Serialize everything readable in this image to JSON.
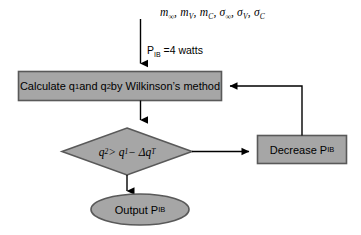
{
  "diagram": {
    "background_color": "#ffffff",
    "shape_fill": "#a6a6a6",
    "shape_stroke": "#595959",
    "line_color": "#000000",
    "inputs": {
      "label_html": "m<sub>∞</sub>, m<sub>V</sub>, m<sub>C</sub>, σ<sub>∞</sub>, σ<sub>V</sub>, σ<sub>C</sub>",
      "variables": [
        "m∞",
        "mV",
        "mC",
        "σ∞",
        "σV",
        "σC"
      ]
    },
    "power_init": {
      "label_html": "P<sub>IB</sub> =4 watts",
      "symbol": "P_IB",
      "value": 4,
      "unit": "watts"
    },
    "process": {
      "label_html": "Calculate q<sub>1</sub> and q<sub>2</sub> by Wilkinson’s method",
      "shape": "rectangle"
    },
    "decision": {
      "label_html": "q<sub>2</sub> &gt; q<sub>1</sub> − Δq<sub>T</sub>",
      "shape": "diamond"
    },
    "feedback": {
      "label_html": "Decrease P<sub>IB</sub>",
      "shape": "rectangle"
    },
    "output": {
      "label_html": "Output P<sub>IB</sub>",
      "shape": "ellipse"
    }
  }
}
